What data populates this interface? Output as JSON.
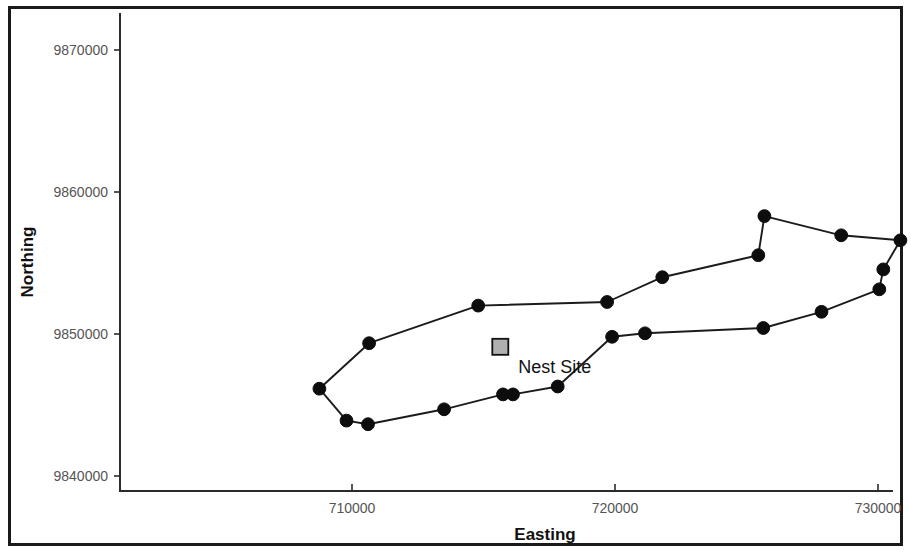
{
  "chart_data": {
    "type": "line",
    "title": "",
    "xlabel": "Easting",
    "ylabel": "Northing",
    "xlim": [
      703650,
      731500
    ],
    "ylim": [
      9838800,
      9871000
    ],
    "xticks": [
      710000,
      720000,
      730000
    ],
    "xtick_labels": [
      "710000",
      "710000",
      "730000"
    ],
    "yticks": [
      9840000,
      9850000,
      9860000,
      9870000
    ],
    "ytick_labels": [
      "9840000",
      "9850000",
      "9860000",
      "9870000"
    ],
    "grid": false,
    "legend": false,
    "closed_polygon": true,
    "series": [
      {
        "name": "Home range boundary",
        "marker": "filled-circle",
        "marker_color": "#0d0d0d",
        "line_color": "#1b1b1b",
        "points": [
          {
            "x": 708760,
            "y": 9846150
          },
          {
            "x": 709790,
            "y": 9843900
          },
          {
            "x": 710610,
            "y": 9843650
          },
          {
            "x": 713500,
            "y": 9844700
          },
          {
            "x": 715740,
            "y": 9845750
          },
          {
            "x": 716120,
            "y": 9845750
          },
          {
            "x": 717820,
            "y": 9846300
          },
          {
            "x": 719890,
            "y": 9849800
          },
          {
            "x": 721140,
            "y": 9850050
          },
          {
            "x": 725640,
            "y": 9850420
          },
          {
            "x": 727850,
            "y": 9851560
          },
          {
            "x": 730050,
            "y": 9853150
          },
          {
            "x": 730200,
            "y": 9854550
          },
          {
            "x": 730850,
            "y": 9856600
          },
          {
            "x": 728600,
            "y": 9856950
          },
          {
            "x": 725680,
            "y": 9858300
          },
          {
            "x": 725450,
            "y": 9855550
          },
          {
            "x": 721800,
            "y": 9854000
          },
          {
            "x": 719700,
            "y": 9852250
          },
          {
            "x": 714800,
            "y": 9852000
          },
          {
            "x": 710650,
            "y": 9849350
          }
        ]
      }
    ],
    "annotations": [
      {
        "label": "Nest Site",
        "x": 715640,
        "y": 9849100,
        "marker": "filled-square",
        "marker_color": "#b0b0b0",
        "marker_edge_color": "#111111"
      }
    ]
  },
  "axes": {
    "x_axis_title": "Easting",
    "y_axis_title": "Northing"
  },
  "icons": {
    "nest_site_marker": "square-marker-icon",
    "track_point_marker": "circle-marker-icon"
  }
}
